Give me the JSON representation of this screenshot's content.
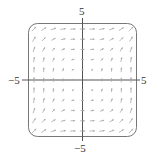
{
  "chart_data": {
    "type": "vector_field",
    "title": "",
    "xlabel": "",
    "ylabel": "",
    "xlim": [
      -5,
      5
    ],
    "ylim": [
      -5,
      5
    ],
    "grid": false,
    "tick_labels": {
      "top": "5",
      "bottom": "−5",
      "left": "−5",
      "right": "5"
    },
    "grid_points_per_axis": 11,
    "field_description": "Arrows point right near the y-axis, up near the x-axis, and diagonally up-right elsewhere; magnitude grows away from origin",
    "field": {
      "u": "y^2",
      "v": "x^2"
    }
  },
  "colors": {
    "frame": "#777777",
    "axis": "#555555",
    "arrow": "#a8a8a8"
  }
}
